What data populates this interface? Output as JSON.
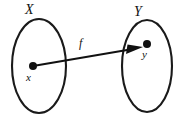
{
  "figure": {
    "type": "set-mapping-diagram",
    "background_color": "#ffffff",
    "ink_color": "#111111",
    "width": 177,
    "height": 124
  },
  "sets": [
    {
      "id": "domain",
      "label": "X",
      "center_x": 39,
      "center_y": 66,
      "radius_x": 27,
      "radius_y": 47,
      "label_x": 30,
      "label_y": 11
    },
    {
      "id": "codomain",
      "label": "Y",
      "center_x": 147,
      "center_y": 66,
      "radius_x": 25,
      "radius_y": 46,
      "label_x": 139,
      "label_y": 13
    }
  ],
  "elements": [
    {
      "id": "domain-element",
      "label": "x",
      "dot_x": 33,
      "dot_y": 66,
      "dot_radius": 4,
      "label_x": 30,
      "label_y": 79
    },
    {
      "id": "codomain-element",
      "label": "y",
      "dot_x": 147,
      "dot_y": 44,
      "dot_radius": 4,
      "label_x": 146,
      "label_y": 56
    }
  ],
  "mapping": {
    "id": "function-arrow",
    "label": "f",
    "from_x": 33,
    "from_y": 66,
    "to_x": 143,
    "to_y": 47,
    "label_x": 84,
    "label_y": 44
  }
}
